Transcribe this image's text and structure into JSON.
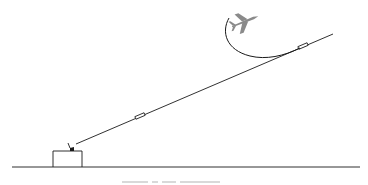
{
  "diagram": {
    "type": "beam-riding-missile-guidance",
    "colors": {
      "background": "#ffffff",
      "line": "#1a1a1a",
      "aircraft": "#8a8a8a"
    },
    "elements": {
      "ground_line": {
        "x1": 12,
        "y1": 167,
        "x2": 360,
        "y2": 167
      },
      "ground_station": {
        "x": 53,
        "y": 151,
        "width": 29,
        "height": 16
      },
      "radar_antenna": {
        "x": 72,
        "y": 150
      },
      "guidance_beam": {
        "x1": 76,
        "y1": 144,
        "x2": 333,
        "y2": 34
      },
      "missile_early": {
        "x": 135,
        "y": 117,
        "angle": -23
      },
      "missile_late": {
        "x": 302,
        "y": 47,
        "angle": -23
      },
      "target_aircraft": {
        "x": 244,
        "y": 22
      },
      "aircraft_trajectory": "M229 18 C 222 32, 228 48, 248 55 C 262 60, 282 56, 300 48"
    },
    "caption": {
      "visible": "partial",
      "note": "caption text cropped at bottom edge; not legible"
    }
  }
}
